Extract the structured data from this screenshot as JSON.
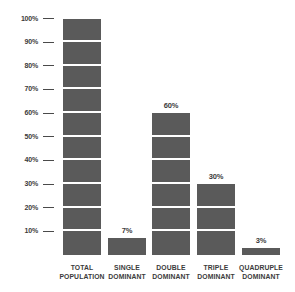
{
  "chart_data": {
    "type": "bar",
    "title": "",
    "subtitle": "",
    "xlabel": "",
    "ylabel": "",
    "ylim": [
      0,
      100
    ],
    "grid": false,
    "legend": null,
    "unit": "%",
    "categories": [
      "TOTAL POPULATION",
      "SINGLE DOMINANT",
      "DOUBLE DOMINANT",
      "TRIPLE DOMINANT",
      "QUADRUPLE DOMINANT"
    ],
    "values": [
      100,
      7,
      60,
      30,
      3
    ],
    "value_labels": [
      "",
      "7%",
      "60%",
      "30%",
      "3%"
    ],
    "y_ticks": [
      100,
      90,
      80,
      70,
      60,
      50,
      40,
      30,
      20,
      10
    ],
    "y_tick_labels": [
      "100%",
      "90%",
      "80%",
      "70%",
      "60%",
      "50%",
      "40%",
      "30%",
      "20%",
      "10%"
    ],
    "bar_color": "#5a5a5a",
    "background_color": "#ffffff",
    "text_color": "#3b3b3b",
    "segment_interval": 10,
    "segment_gap_color": "#ffffff"
  },
  "bars": [
    {
      "id": "total-population",
      "value": 100,
      "value_label": "",
      "label_line1": "TOTAL",
      "label_line2": "POPULATION"
    },
    {
      "id": "single-dominant",
      "value": 7,
      "value_label": "7%",
      "label_line1": "SINGLE",
      "label_line2": "DOMINANT"
    },
    {
      "id": "double-dominant",
      "value": 60,
      "value_label": "60%",
      "label_line1": "DOUBLE",
      "label_line2": "DOMINANT"
    },
    {
      "id": "triple-dominant",
      "value": 30,
      "value_label": "30%",
      "label_line1": "TRIPLE",
      "label_line2": "DOMINANT"
    },
    {
      "id": "quadruple-dominant",
      "value": 3,
      "value_label": "3%",
      "label_line1": "QUADRUPLE",
      "label_line2": "DOMINANT"
    }
  ],
  "y_axis": {
    "ticks": [
      {
        "label": "100%"
      },
      {
        "label": "90%"
      },
      {
        "label": "80%"
      },
      {
        "label": "70%"
      },
      {
        "label": "60%"
      },
      {
        "label": "50%"
      },
      {
        "label": "40%"
      },
      {
        "label": "30%"
      },
      {
        "label": "20%"
      },
      {
        "label": "10%"
      }
    ]
  }
}
